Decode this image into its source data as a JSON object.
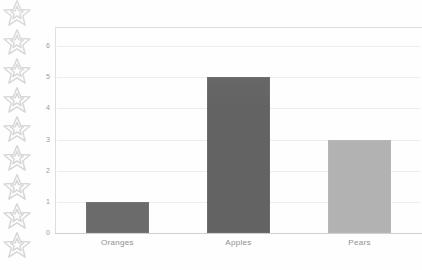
{
  "chart_data": {
    "type": "bar",
    "title": "",
    "xlabel": "",
    "ylabel": "",
    "categories": [
      "Oranges",
      "Apples",
      "Pears"
    ],
    "values": [
      1,
      5,
      3
    ],
    "ylim": [
      0,
      6
    ],
    "yticks": [
      0,
      1,
      2,
      3,
      4,
      5,
      6
    ],
    "ytick_labels": [
      "0",
      "1",
      "2",
      "3",
      "4",
      "5",
      "6"
    ],
    "grid": true,
    "legend": "none",
    "bar_colors": [
      "#6b6b6b",
      "#636363",
      "#b2b2b2"
    ]
  },
  "colors": {
    "gridline": "#ededed",
    "axis": "#cfcfcf",
    "tick_text": "#9a9a9a",
    "category_text": "#8f8f8f",
    "star_outline": "#b9b9b9",
    "background": "#fefefe"
  },
  "decoration": {
    "star_icon_name": "star-outline-icon",
    "star_count": 9
  }
}
